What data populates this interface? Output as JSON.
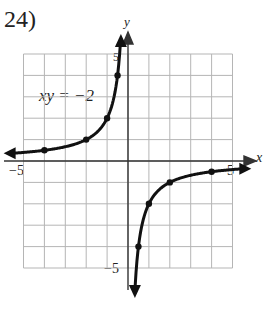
{
  "problem": {
    "number": "24)",
    "equation": "xy = −2"
  },
  "axes": {
    "x_label": "x",
    "y_label": "y",
    "tick_labels": {
      "x_neg": "−5",
      "x_pos": "5",
      "y_pos": "5",
      "y_neg": "−5"
    },
    "range": [
      -5,
      5
    ]
  },
  "curve": {
    "color": "#111111",
    "branch_left_points": [
      [
        -4,
        0.5
      ],
      [
        -2,
        1
      ],
      [
        -1,
        2
      ],
      [
        -0.5,
        4
      ]
    ],
    "branch_right_points": [
      [
        0.5,
        -4
      ],
      [
        1,
        -2
      ],
      [
        2,
        -1
      ],
      [
        4,
        -0.5
      ]
    ]
  },
  "chart_data": {
    "type": "line",
    "title": "xy = −2",
    "xlabel": "x",
    "ylabel": "y",
    "xlim": [
      -5,
      5
    ],
    "ylim": [
      -5,
      5
    ],
    "grid": true,
    "series": [
      {
        "name": "left branch",
        "x": [
          -4,
          -2,
          -1,
          -0.5
        ],
        "y": [
          0.5,
          1,
          2,
          4
        ]
      },
      {
        "name": "right branch",
        "x": [
          0.5,
          1,
          2,
          4
        ],
        "y": [
          -4,
          -2,
          -1,
          -0.5
        ]
      }
    ]
  }
}
